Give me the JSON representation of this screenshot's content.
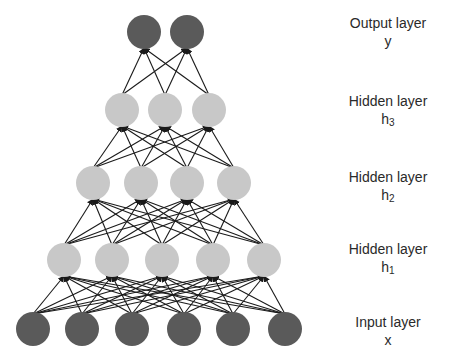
{
  "colors": {
    "input_node": "#5a5a5a",
    "hidden_node": "#c8c8c8",
    "output_node": "#5a5a5a",
    "edge": "#1a1a1a",
    "text": "#2a2a2a"
  },
  "node_radius": 17,
  "layers": [
    {
      "id": "input",
      "title": "Input layer",
      "symbol": "x",
      "subscript": "",
      "y": 329,
      "xs": [
        33,
        82,
        132,
        184,
        233,
        285
      ],
      "label_y": 310,
      "kind": "input"
    },
    {
      "id": "h1",
      "title": "Hidden layer",
      "symbol": "h",
      "subscript": "1",
      "y": 260,
      "xs": [
        64,
        112,
        162,
        213,
        264
      ],
      "label_y": 240,
      "kind": "hidden"
    },
    {
      "id": "h2",
      "title": "Hidden layer",
      "symbol": "h",
      "subscript": "2",
      "y": 183,
      "xs": [
        93,
        141,
        187,
        234
      ],
      "label_y": 170,
      "kind": "hidden"
    },
    {
      "id": "h3",
      "title": "Hidden layer",
      "symbol": "h",
      "subscript": "3",
      "y": 110,
      "xs": [
        122,
        165,
        209
      ],
      "label_y": 93,
      "kind": "hidden"
    },
    {
      "id": "output",
      "title": "Output layer",
      "symbol": "y",
      "subscript": "",
      "y": 32,
      "xs": [
        144,
        187
      ],
      "label_y": 15,
      "kind": "output"
    }
  ],
  "labels": {
    "output": {
      "title": "Output layer",
      "symbol": "y"
    },
    "h3": {
      "title": "Hidden layer",
      "symbol": "h",
      "subscript": "3"
    },
    "h2": {
      "title": "Hidden layer",
      "symbol": "h",
      "subscript": "2"
    },
    "h1": {
      "title": "Hidden layer",
      "symbol": "h",
      "subscript": "1"
    },
    "input": {
      "title": "Input layer",
      "symbol": "x"
    }
  }
}
